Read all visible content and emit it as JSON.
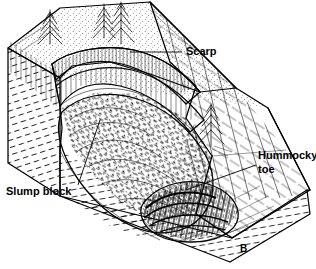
{
  "figure": {
    "letter": "B",
    "background_color": "#ffffff",
    "line_color": "#000000"
  },
  "annotations": [
    {
      "id": "scarp",
      "label": "Scarp",
      "text_x": 186,
      "text_y": 52,
      "leader": "M182,52 L130,52"
    },
    {
      "id": "hummocky-toe",
      "label_line1": "Hummocky",
      "label_line2": "toe",
      "text_x": 258,
      "text_y": 158,
      "leader": "M256,165 L186,190"
    },
    {
      "id": "slump-block",
      "label": "Slump block",
      "text_x": 6,
      "text_y": 192,
      "leader": "M78,185 L100,120"
    }
  ],
  "scene": {
    "terrain_elements": [
      "upper-forested-plateau",
      "arcuate-scarp-face",
      "secondary-scarp-bench",
      "slump-block-mass",
      "hummocky-toe-ridges",
      "undisturbed-hillslope",
      "block-diagram-left-face",
      "block-diagram-front-face"
    ],
    "trees": [
      {
        "x": 50,
        "y": 36,
        "height": 30
      },
      {
        "x": 104,
        "y": 28,
        "height": 26
      },
      {
        "x": 119,
        "y": 22,
        "height": 32
      },
      {
        "x": 211,
        "y": 130,
        "height": 32
      }
    ]
  }
}
